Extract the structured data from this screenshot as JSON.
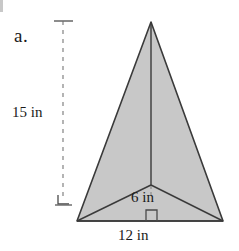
{
  "figure": {
    "item_label": "a.",
    "background_color": "#ffffff",
    "fill_color": "#c8c8c8",
    "stroke_color": "#3a3a3a",
    "dashed_color": "#8c8c8c",
    "text_color": "#1a1a1a"
  },
  "labels": {
    "height": "15 in",
    "slant_height": "6 in",
    "base": "12 in"
  },
  "geometry": {
    "apex": {
      "x": 151,
      "y": 22
    },
    "bottom_left": {
      "x": 77,
      "y": 221
    },
    "bottom_right": {
      "x": 223,
      "y": 221
    },
    "internal_vertex": {
      "x": 151,
      "y": 185
    },
    "dimension_line_x": 63,
    "dimension_line_top_y": 21,
    "dimension_line_bottom_y": 205
  },
  "measurements": {
    "height_value": 15,
    "height_unit": "in",
    "slant_value": 6,
    "slant_unit": "in",
    "base_value": 12,
    "base_unit": "in"
  }
}
